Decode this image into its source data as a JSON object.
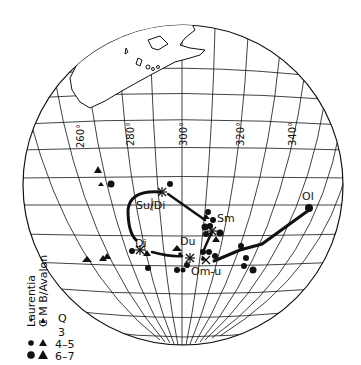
{
  "map": {
    "projection": "orthographic-globe",
    "longitude_labels": [
      "260°",
      "280°",
      "300°",
      "320°",
      "340°"
    ],
    "ink_color": "#111111",
    "background": "#ffffff"
  },
  "paths": {
    "labels": {
      "su_di": "Su/Di",
      "di": "Di",
      "du": "Du",
      "sm": "Sm",
      "om_u": "Om-u",
      "ol": "Ol"
    }
  },
  "legend": {
    "series": [
      "Laurentia",
      "C M B/Avalon"
    ],
    "quality_header": "Q",
    "rows": [
      {
        "q": "3"
      },
      {
        "q": "4–5"
      },
      {
        "q": "6–7"
      }
    ]
  }
}
